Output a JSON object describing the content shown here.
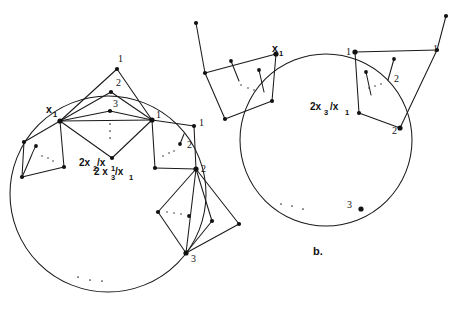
{
  "figure": {
    "caption": "b.",
    "stroke_color": "#1a1a1a",
    "vertex_color": "#111111",
    "background": "#ffffff"
  },
  "panel_a": {
    "name": "left-diagram",
    "circle": {
      "cx": 108,
      "cy": 194,
      "r": 98
    },
    "hub_labels": {
      "x1": "x",
      "x1_sub": "1",
      "one": "1",
      "two": "2",
      "three": "3"
    },
    "apex_labels": [
      {
        "text": "1",
        "x": 118,
        "y": 61
      },
      {
        "text": "2",
        "x": 116,
        "y": 85
      },
      {
        "text": "3",
        "x": 114,
        "y": 106
      }
    ],
    "right_fan_labels": [
      {
        "text": "1",
        "x": 200,
        "y": 124
      },
      {
        "text": "2",
        "x": 188,
        "y": 147
      }
    ],
    "ring_labels": [
      {
        "text": "1",
        "x": 158,
        "y": 119
      },
      {
        "text": "2",
        "x": 203,
        "y": 175
      },
      {
        "text": "3",
        "x": 196,
        "y": 259
      }
    ],
    "fraction_upper": {
      "lead": "2x",
      "sub1": "2",
      "slash": "/x",
      "sub2": "1"
    },
    "fraction_lower": {
      "lead": "2 x",
      "sub1": "3",
      "slash": "/x",
      "sub2": "1"
    }
  },
  "panel_b": {
    "name": "right-diagram",
    "circle": {
      "cx": 326,
      "cy": 140,
      "r": 86
    },
    "hub_labels": {
      "x1": "x",
      "x1_sub": "1"
    },
    "ring_labels": [
      {
        "text": "1",
        "x": 349,
        "y": 54
      },
      {
        "text": "2",
        "x": 395,
        "y": 131
      },
      {
        "text": "3",
        "x": 348,
        "y": 209
      }
    ],
    "outer_labels": [
      {
        "text": "1",
        "x": 434,
        "y": 51
      },
      {
        "text": "2",
        "x": 398,
        "y": 80
      }
    ],
    "fraction": {
      "lead": "2x",
      "sub1": "3",
      "slash": "/x",
      "sub2": "1"
    },
    "caption": "b."
  }
}
